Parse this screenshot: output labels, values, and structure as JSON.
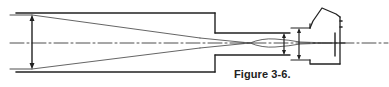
{
  "figure": {
    "caption": "Figure 3-6.",
    "colors": {
      "line": "#222222",
      "background": "#ffffff"
    }
  }
}
